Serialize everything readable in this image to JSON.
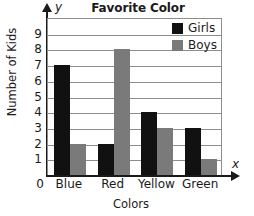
{
  "chart_data": {
    "type": "bar",
    "title": "Favorite Color",
    "xlabel": "Colors",
    "ylabel": "Number of Kids",
    "categories": [
      "Blue",
      "Red",
      "Yellow",
      "Green"
    ],
    "series": [
      {
        "name": "Girls",
        "color": "#111111",
        "values": [
          7,
          2,
          4,
          3
        ]
      },
      {
        "name": "Boys",
        "color": "#7a7a7a",
        "values": [
          2,
          8,
          3,
          1
        ]
      }
    ],
    "ylim": [
      0,
      10
    ],
    "ytick_labels": [
      "9",
      "8",
      "7",
      "6",
      "5",
      "4",
      "3",
      "2",
      "1"
    ],
    "ytick_values": [
      9,
      8,
      7,
      6,
      5,
      4,
      3,
      2,
      1
    ],
    "origin_label": "0",
    "grid": true,
    "legend_position": "top-right",
    "axis_tip_y": "y",
    "axis_tip_x": "x"
  },
  "legend": {
    "items": [
      {
        "label": "Girls"
      },
      {
        "label": "Boys"
      }
    ]
  }
}
